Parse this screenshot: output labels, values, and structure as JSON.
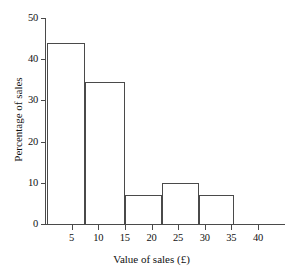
{
  "chart_data": {
    "type": "bar",
    "title": "",
    "subtitle": "",
    "xlabel": "Value of sales (£)",
    "ylabel": "Percentage of sales",
    "xlim": [
      0,
      40
    ],
    "ylim": [
      0,
      50
    ],
    "grid": false,
    "legend": "none",
    "note": "Histogram with unequal class widths; bar edges read off the value axis.",
    "x_ticks": [
      {
        "value": 5,
        "label": "5"
      },
      {
        "value": 10,
        "label": "10"
      },
      {
        "value": 15,
        "label": "15"
      },
      {
        "value": 20,
        "label": "20"
      },
      {
        "value": 25,
        "label": "25"
      },
      {
        "value": 30,
        "label": "30"
      },
      {
        "value": 35,
        "label": "35"
      },
      {
        "value": 40,
        "label": "40"
      }
    ],
    "y_ticks": [
      {
        "value": 0,
        "label": "0"
      },
      {
        "value": 10,
        "label": "10"
      },
      {
        "value": 20,
        "label": "20"
      },
      {
        "value": 30,
        "label": "30"
      },
      {
        "value": 40,
        "label": "40"
      },
      {
        "value": 50,
        "label": "50"
      }
    ],
    "bars": [
      {
        "x_start": 0.3,
        "x_end": 7.5,
        "value": 44.0,
        "label": "0–7.5"
      },
      {
        "x_start": 7.5,
        "x_end": 15.0,
        "value": 34.5,
        "label": "7.5–15"
      },
      {
        "x_start": 15.0,
        "x_end": 22.0,
        "value": 7.0,
        "label": "15–22"
      },
      {
        "x_start": 22.0,
        "x_end": 29.0,
        "value": 10.0,
        "label": "22–29"
      },
      {
        "x_start": 29.0,
        "x_end": 35.5,
        "value": 7.0,
        "label": "29–35.5"
      }
    ],
    "categories": [
      "0–7.5",
      "7.5–15",
      "15–22",
      "22–29",
      "29–35.5"
    ],
    "values": [
      44.0,
      34.5,
      7.0,
      10.0,
      7.0
    ],
    "colors": {
      "axis": "#4a4a4a",
      "bar_stroke": "#4a4a4a",
      "bar_fill": "transparent",
      "text": "#111111",
      "background": "#ffffff"
    }
  }
}
